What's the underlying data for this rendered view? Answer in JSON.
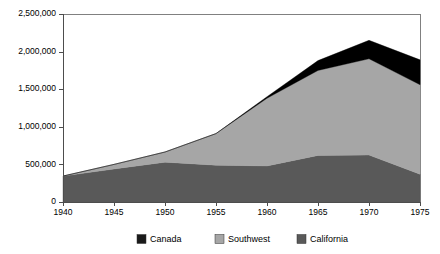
{
  "chart_data": {
    "type": "area",
    "stacked": true,
    "title": "",
    "subtitle": "",
    "xlabel": "",
    "ylabel": "",
    "x": [
      1940,
      1945,
      1950,
      1955,
      1960,
      1965,
      1970,
      1975
    ],
    "xtick_labels": [
      "1940",
      "1945",
      "1950",
      "1955",
      "1960",
      "1965",
      "1970",
      "1975"
    ],
    "xlim": [
      1940,
      1975
    ],
    "ylim": [
      0,
      2500000
    ],
    "ytick_values": [
      0,
      500000,
      1000000,
      1500000,
      2000000,
      2500000
    ],
    "ytick_labels": [
      "0",
      "500,000",
      "1,000,000",
      "1,500,000",
      "2,000,000",
      "2,500,000"
    ],
    "grid": false,
    "legend_position": "bottom",
    "stack_order_bottom_to_top": [
      "California",
      "Southwest",
      "Canada"
    ],
    "series": [
      {
        "name": "California",
        "color": "#595959",
        "values": [
          345000,
          440000,
          530000,
          490000,
          480000,
          620000,
          625000,
          370000
        ]
      },
      {
        "name": "Southwest",
        "color": "#a6a6a6",
        "values": [
          0,
          60000,
          135000,
          420000,
          900000,
          1130000,
          1280000,
          1190000
        ]
      },
      {
        "name": "Canada",
        "color": "#000000",
        "values": [
          0,
          0,
          0,
          0,
          20000,
          130000,
          245000,
          330000
        ]
      }
    ],
    "totals": [
      345000,
      500000,
      665000,
      910000,
      1400000,
      1880000,
      2150000,
      1890000
    ],
    "legend": [
      {
        "label": "Canada",
        "color": "#1a1a1a"
      },
      {
        "label": "Southwest",
        "color": "#a6a6a6"
      },
      {
        "label": "California",
        "color": "#595959"
      }
    ]
  },
  "plot": {
    "left": 63,
    "right": 420,
    "top": 14,
    "bottom": 202
  }
}
